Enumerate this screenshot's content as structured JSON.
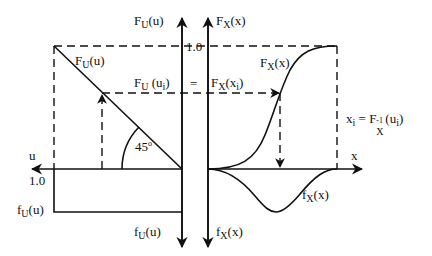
{
  "diagram": {
    "colors": {
      "line": "#111111",
      "background": "#ffffff"
    },
    "left_panel": {
      "vertical_axis_up_label": {
        "main": "F",
        "sub": "U",
        "arg": "(u)"
      },
      "vertical_axis_down_label": {
        "main": "f",
        "sub": "U",
        "arg": "(u)"
      },
      "horizontal_axis_label": "u",
      "tick_one_top": "1.0",
      "tick_one_left": "1.0",
      "cdf_curve_label": {
        "main": "F",
        "sub": "U",
        "arg": "(u)"
      },
      "pdf_label": {
        "main": "f",
        "sub": "U",
        "arg": "(u)"
      },
      "angle_label": "45",
      "angle_unit": "o"
    },
    "right_panel": {
      "vertical_axis_up_label": {
        "main": "F",
        "sub": "X",
        "arg": "(x)"
      },
      "vertical_axis_down_label": {
        "main": "f",
        "sub": "X",
        "arg": "(x)"
      },
      "horizontal_axis_label": "x",
      "cdf_curve_label": {
        "main": "F",
        "sub": "X",
        "arg": "(x)"
      },
      "pdf_curve_label": {
        "main": "f",
        "sub": "X",
        "arg": "(x)"
      }
    },
    "equality": {
      "left": {
        "main": "F",
        "sub": "U",
        "arg_open": " (u",
        "arg_sub": "i",
        "arg_close": ")"
      },
      "sign": "=",
      "right": {
        "main": "F",
        "sub": "X",
        "arg_open": "(x",
        "arg_sub": "i",
        "arg_close": ")"
      }
    },
    "inverse_formula": {
      "lhs_main": "x",
      "lhs_sub": "i",
      "eq": "=",
      "F": "F",
      "F_sup": "-1",
      "F_sub": "X",
      "arg_open": "(u",
      "arg_sub": "i",
      "arg_close": ")"
    }
  }
}
